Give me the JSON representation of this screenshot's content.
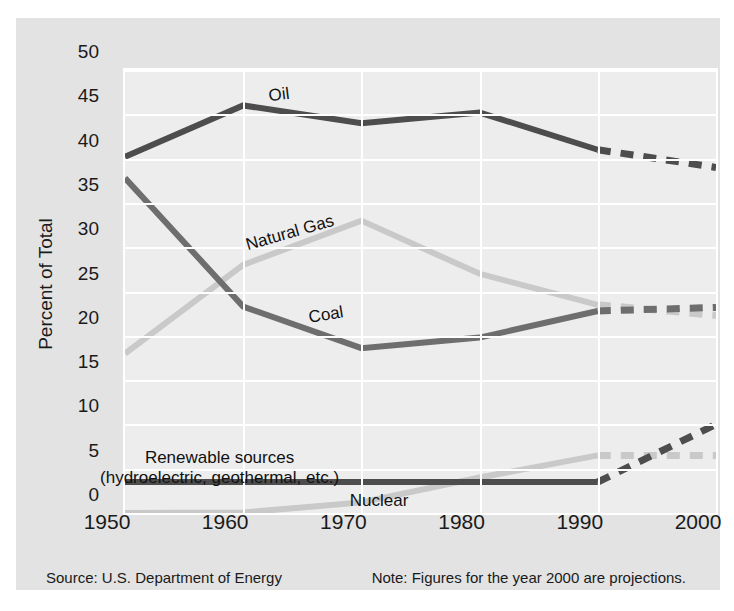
{
  "chart_data": {
    "type": "line",
    "title": "",
    "xlabel": "",
    "ylabel": "Percent of Total",
    "x": [
      1950,
      1960,
      1970,
      1980,
      1990,
      2000
    ],
    "xtick_labels": [
      "1950",
      "1960",
      "1970",
      "1980",
      "1990",
      "2000"
    ],
    "ytick_labels": [
      "0",
      "5",
      "10",
      "15",
      "20",
      "25",
      "30",
      "35",
      "40",
      "45",
      "50"
    ],
    "ylim": [
      0,
      50
    ],
    "xlim": [
      1950,
      2000
    ],
    "ytick_step": 5,
    "grid": true,
    "legend_position": "inline-labels",
    "projection_start_year": 1990,
    "projection_style": "dashed",
    "series": [
      {
        "name": "Oil",
        "color": "#4d4d4d",
        "values": [
          40.2,
          46.0,
          44.0,
          45.2,
          41.0,
          39.0
        ],
        "label_x": 1963,
        "label_y": 47.2,
        "label_rotation": -7
      },
      {
        "name": "Natural Gas",
        "color": "#c9c9c9",
        "values": [
          18.0,
          28.0,
          33.0,
          27.0,
          23.5,
          22.3
        ],
        "label_x": 1964,
        "label_y": 31.6,
        "label_rotation": -16
      },
      {
        "name": "Coal",
        "color": "#6e6e6e",
        "values": [
          37.8,
          23.3,
          18.6,
          19.8,
          22.8,
          23.2
        ],
        "label_x": 1967,
        "label_y": 22.3,
        "label_rotation": -9
      },
      {
        "name": "Renewable sources\n(hydroelectric, geothermal, etc.)",
        "color": "#4d4d4d",
        "values": [
          3.5,
          3.5,
          3.5,
          3.5,
          3.5,
          10.0
        ],
        "label_line1": "Renewable sources",
        "label_line2": "(hydroelectric, geothermal, etc.)",
        "label_x": 1958,
        "label_y": 6.2,
        "label_rotation": 0
      },
      {
        "name": "Nuclear",
        "color": "#c9c9c9",
        "values": [
          0.0,
          0.05,
          1.2,
          4.0,
          6.5,
          6.5
        ],
        "label_x": 1971.5,
        "label_y": 1.3,
        "label_rotation": 0
      }
    ]
  },
  "footer": {
    "source": "Source: U.S. Department of Energy",
    "note": "Note: Figures for the year 2000 are projections."
  },
  "colors": {
    "page_background": "#ffffff",
    "panel_background": "#e3e3e3",
    "plot_background": "#ededed",
    "gridline": "#ffffff",
    "text": "#1a1a1a",
    "dark_series": "#4d4d4d",
    "mid_series": "#6e6e6e",
    "light_series": "#c9c9c9"
  }
}
